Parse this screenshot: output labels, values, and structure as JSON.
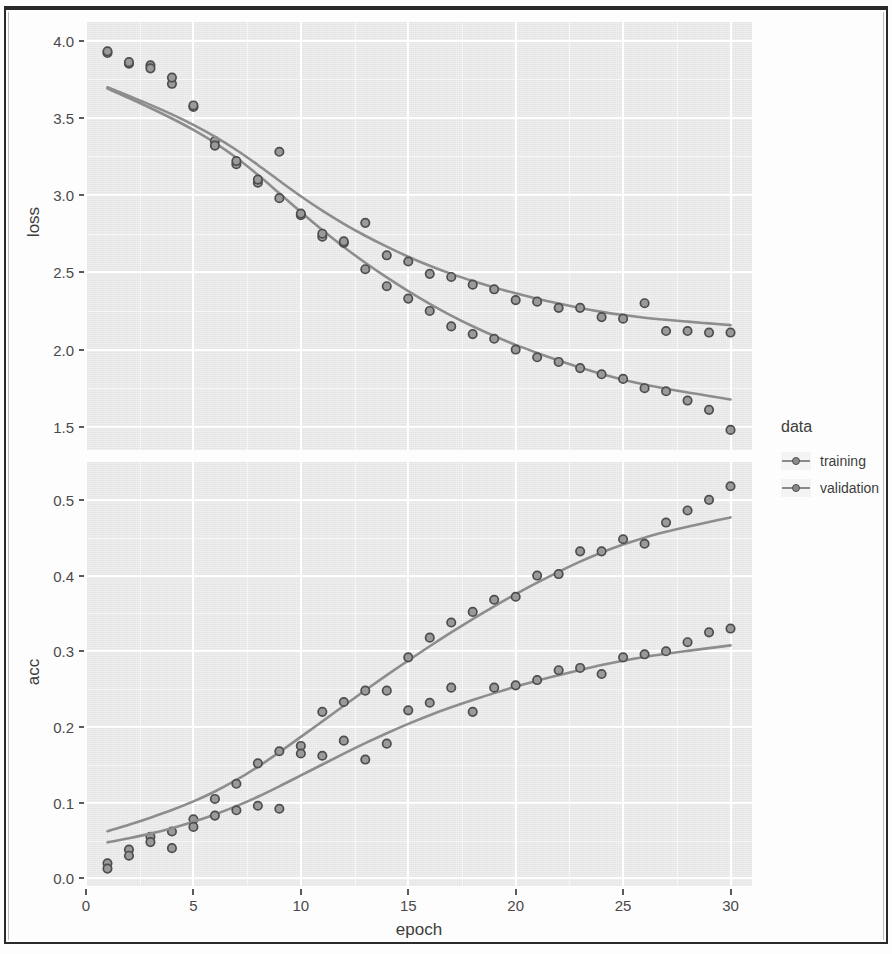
{
  "axes": {
    "x_label": "epoch",
    "x_ticks": [
      "0",
      "5",
      "10",
      "15",
      "20",
      "25",
      "30"
    ],
    "panels": [
      {
        "id": "loss",
        "y_label": "loss",
        "y_ticks": [
          "4.0",
          "3.5",
          "3.0",
          "2.5",
          "2.0",
          "1.5"
        ]
      },
      {
        "id": "acc",
        "y_label": "acc",
        "y_ticks": [
          "0.5",
          "0.4",
          "0.3",
          "0.2",
          "0.1",
          "0.0"
        ]
      }
    ]
  },
  "legend": {
    "title": "data",
    "items": [
      {
        "label": "training",
        "color": "#8a8a8a",
        "key_icon": "line-point-icon"
      },
      {
        "label": "validation",
        "color": "#8a8a8a",
        "key_icon": "line-point-icon"
      }
    ]
  },
  "chart_data": [
    {
      "type": "scatter",
      "id": "loss-panel",
      "title": "",
      "xlabel": "epoch",
      "ylabel": "loss",
      "xlim": [
        0,
        31
      ],
      "ylim": [
        1.35,
        4.12
      ],
      "grid": true,
      "legend_position": "right",
      "x": [
        1,
        2,
        3,
        4,
        5,
        6,
        7,
        8,
        9,
        10,
        11,
        12,
        13,
        14,
        15,
        16,
        17,
        18,
        19,
        20,
        21,
        22,
        23,
        24,
        25,
        26,
        27,
        28,
        29,
        30
      ],
      "series": [
        {
          "name": "training",
          "smooth": true,
          "values": [
            3.92,
            3.85,
            3.84,
            3.72,
            3.57,
            3.35,
            3.2,
            3.08,
            2.98,
            2.87,
            2.73,
            2.69,
            2.52,
            2.41,
            2.33,
            2.25,
            2.15,
            2.1,
            2.07,
            2.0,
            1.95,
            1.92,
            1.88,
            1.84,
            1.81,
            1.75,
            1.73,
            1.67,
            1.61,
            1.48
          ]
        },
        {
          "name": "validation",
          "smooth": true,
          "values": [
            3.93,
            3.86,
            3.82,
            3.76,
            3.58,
            3.32,
            3.22,
            3.1,
            3.28,
            2.88,
            2.75,
            2.7,
            2.82,
            2.61,
            2.57,
            2.49,
            2.47,
            2.42,
            2.39,
            2.32,
            2.31,
            2.27,
            2.27,
            2.21,
            2.2,
            2.3,
            2.12,
            2.12,
            2.11,
            2.11
          ]
        }
      ]
    },
    {
      "type": "scatter",
      "id": "acc-panel",
      "title": "",
      "xlabel": "epoch",
      "ylabel": "acc",
      "xlim": [
        0,
        31
      ],
      "ylim": [
        -0.01,
        0.55
      ],
      "grid": true,
      "legend_position": "right",
      "x": [
        1,
        2,
        3,
        4,
        5,
        6,
        7,
        8,
        9,
        10,
        11,
        12,
        13,
        14,
        15,
        16,
        17,
        18,
        19,
        20,
        21,
        22,
        23,
        24,
        25,
        26,
        27,
        28,
        29,
        30
      ],
      "series": [
        {
          "name": "training",
          "smooth": true,
          "values": [
            0.02,
            0.038,
            0.055,
            0.062,
            0.078,
            0.105,
            0.125,
            0.152,
            0.168,
            0.175,
            0.22,
            0.233,
            0.248,
            0.248,
            0.292,
            0.318,
            0.338,
            0.352,
            0.368,
            0.372,
            0.4,
            0.402,
            0.432,
            0.432,
            0.448,
            0.442,
            0.47,
            0.486,
            0.5,
            0.518
          ]
        },
        {
          "name": "validation",
          "smooth": true,
          "values": [
            0.013,
            0.03,
            0.048,
            0.04,
            0.068,
            0.083,
            0.09,
            0.096,
            0.092,
            0.165,
            0.162,
            0.182,
            0.157,
            0.178,
            0.222,
            0.232,
            0.252,
            0.22,
            0.252,
            0.255,
            0.262,
            0.275,
            0.278,
            0.27,
            0.292,
            0.296,
            0.3,
            0.312,
            0.325,
            0.33
          ]
        }
      ]
    }
  ]
}
